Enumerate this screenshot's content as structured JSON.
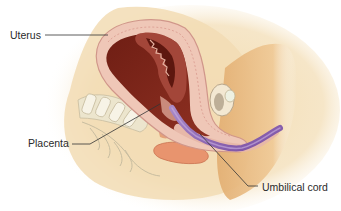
{
  "figure": {
    "labels": {
      "uterus": "Uterus",
      "placenta": "Placenta",
      "umbilical_cord": "Umbilical cord"
    },
    "colors": {
      "background": "#ffffff",
      "skin_glow": "#f6e4c4",
      "body_tissue": "#f2ddb4",
      "leg_tan": "#e9bf86",
      "uterine_wall": "#eec4b4",
      "uterine_wall_stripe": "#d99a8f",
      "uterine_cavity": "#7e2419",
      "placenta": "#a2443a",
      "placenta_dark": "#5d170f",
      "umbilical_cord": "#8c62b0",
      "spine_bone": "#ece6cf",
      "bowel": "#e6916d",
      "leader_line": "#333333",
      "label_text": "#2a2a2a"
    }
  }
}
